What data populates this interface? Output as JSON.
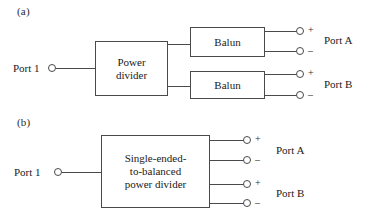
{
  "figure": {
    "background_color": "#ffffff",
    "line_color": "#4a4a4a",
    "text_color": "#1a1a1a"
  },
  "panel_a": {
    "label": "(a)",
    "input_port_label": "Port 1",
    "divider_block_text": "Power\ndivider",
    "balun_top_text": "Balun",
    "balun_bottom_text": "Balun",
    "port_a_label": "Port A",
    "port_b_label": "Port B",
    "plus_sign_a": "+",
    "minus_sign_a": "–",
    "plus_sign_b": "+",
    "minus_sign_b": "–"
  },
  "panel_b": {
    "label": "(b)",
    "input_port_label": "Port 1",
    "divider_block_text": "Single-ended-\nto-balanced\npower divider",
    "port_a_label": "Port A",
    "port_b_label": "Port B",
    "plus_sign_a": "+",
    "minus_sign_a": "–",
    "plus_sign_b": "+",
    "minus_sign_b": "–"
  }
}
